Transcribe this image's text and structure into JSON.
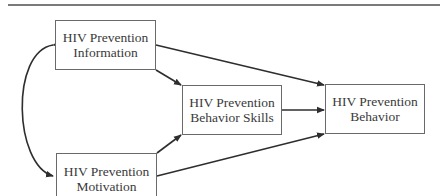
{
  "diagram": {
    "type": "path-model",
    "nodes": {
      "information": {
        "line1": "HIV Prevention",
        "line2": "Information"
      },
      "motivation": {
        "line1": "HIV Prevention",
        "line2": "Motivation"
      },
      "skills": {
        "line1": "HIV Prevention",
        "line2": "Behavior Skills"
      },
      "behavior": {
        "line1": "HIV Prevention",
        "line2": "Behavior"
      }
    },
    "edges": [
      {
        "from": "information",
        "to": "motivation",
        "style": "curved-bidirectional"
      },
      {
        "from": "information",
        "to": "skills",
        "style": "arrow"
      },
      {
        "from": "information",
        "to": "behavior",
        "style": "arrow"
      },
      {
        "from": "motivation",
        "to": "skills",
        "style": "arrow"
      },
      {
        "from": "motivation",
        "to": "behavior",
        "style": "arrow"
      },
      {
        "from": "skills",
        "to": "behavior",
        "style": "arrow"
      }
    ],
    "colors": {
      "line": "#2e2e2e",
      "box_border": "#6a6a6a",
      "text": "#3a3a3a",
      "rule": "#7a7a7a"
    }
  }
}
